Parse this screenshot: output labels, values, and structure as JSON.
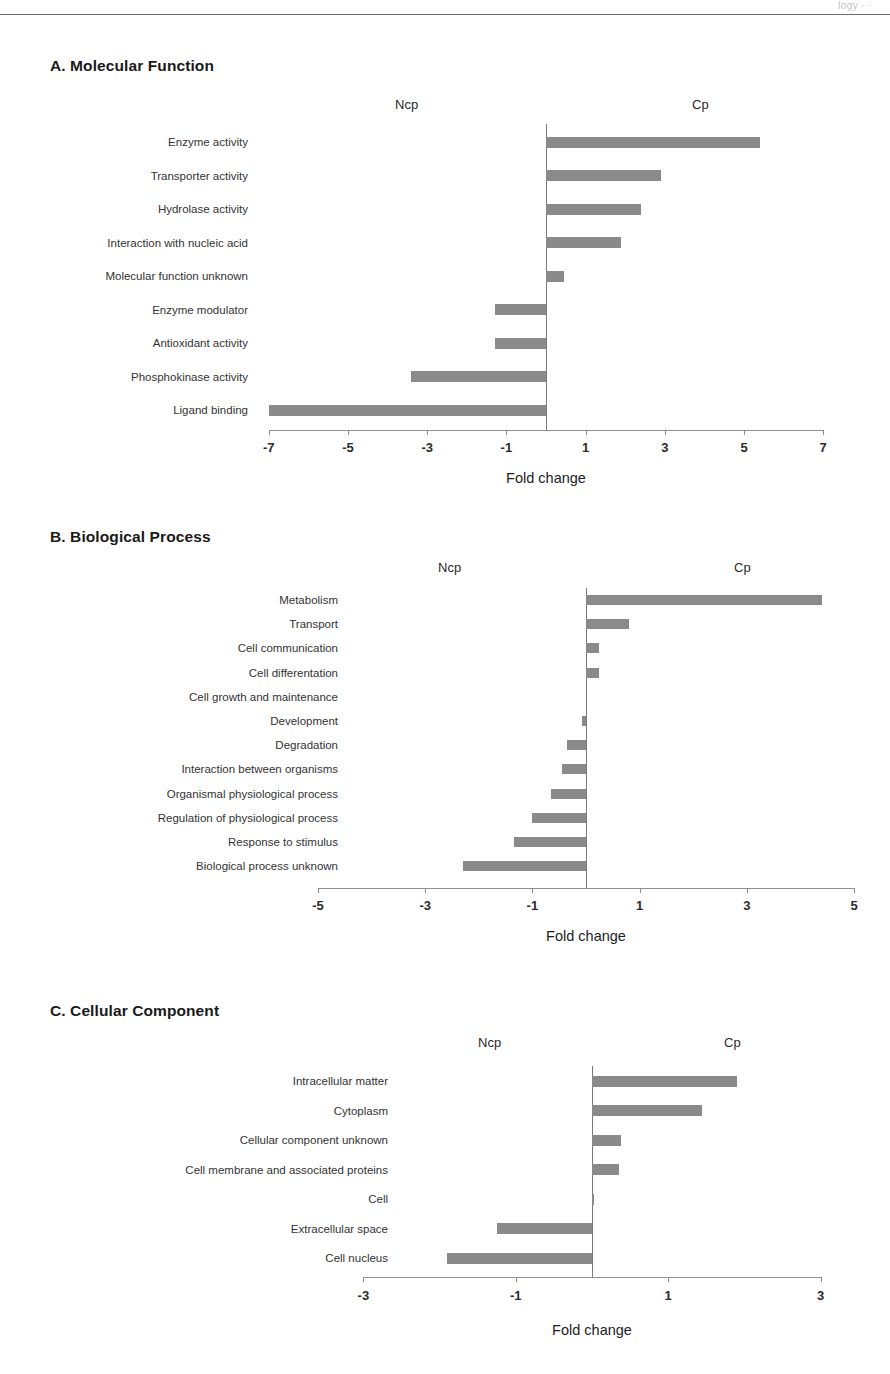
{
  "page": {
    "header_sliver": "logy · ·",
    "bar_color": "#8a8a8a",
    "axis_color": "#8e8e8e"
  },
  "panels": [
    {
      "id": "a",
      "title": "A. Molecular Function",
      "left_group_label": "Ncp",
      "right_group_label": "Cp",
      "axis_title": "Fold change",
      "chart_data": {
        "type": "bar",
        "orientation": "horizontal",
        "title": "A. Molecular Function",
        "xlabel": "Fold change",
        "ylabel": "",
        "xlim": [
          -7,
          7
        ],
        "xticks": [
          -7,
          -5,
          -3,
          -1,
          1,
          3,
          5,
          7
        ],
        "grid": false,
        "legend": [
          "Ncp",
          "Cp"
        ],
        "legend_position": "top",
        "categories": [
          "Enzyme activity",
          "Transporter activity",
          "Hydrolase activity",
          "Interaction with nucleic acid",
          "Molecular function unknown",
          "Enzyme modulator",
          "Antioxidant activity",
          "Phosphokinase activity",
          "Ligand binding"
        ],
        "values": [
          5.4,
          2.9,
          2.4,
          1.9,
          0.45,
          -1.3,
          -1.3,
          -3.4,
          -7.0
        ]
      }
    },
    {
      "id": "b",
      "title": "B. Biological Process",
      "left_group_label": "Ncp",
      "right_group_label": "Cp",
      "axis_title": "Fold change",
      "chart_data": {
        "type": "bar",
        "orientation": "horizontal",
        "title": "B. Biological Process",
        "xlabel": "Fold change",
        "ylabel": "",
        "xlim": [
          -5,
          5
        ],
        "xticks": [
          -5,
          -3,
          -1,
          1,
          3,
          5
        ],
        "grid": false,
        "legend": [
          "Ncp",
          "Cp"
        ],
        "legend_position": "top",
        "categories": [
          "Metabolism",
          "Transport",
          "Cell communication",
          "Cell differentation",
          "Cell growth and maintenance",
          "Development",
          "Degradation",
          "Interaction between organisms",
          "Organismal physiological process",
          "Regulation of physiological process",
          "Response to stimulus",
          "Biological process unknown"
        ],
        "values": [
          4.4,
          0.8,
          0.25,
          0.25,
          0.0,
          -0.08,
          -0.35,
          -0.45,
          -0.65,
          -1.0,
          -1.35,
          -2.3
        ]
      }
    },
    {
      "id": "c",
      "title": "C. Cellular Component",
      "left_group_label": "Ncp",
      "right_group_label": "Cp",
      "axis_title": "Fold change",
      "chart_data": {
        "type": "bar",
        "orientation": "horizontal",
        "title": "C. Cellular Component",
        "xlabel": "Fold change",
        "ylabel": "",
        "xlim": [
          -3,
          3
        ],
        "xticks": [
          -3,
          -1,
          1,
          3
        ],
        "grid": false,
        "legend": [
          "Ncp",
          "Cp"
        ],
        "legend_position": "top",
        "categories": [
          "Intracellular matter",
          "Cytoplasm",
          "Cellular component unknown",
          "Cell membrane and associated proteins",
          "Cell",
          "Extracellular space",
          "Cell nucleus"
        ],
        "values": [
          1.9,
          1.45,
          0.38,
          0.36,
          0.03,
          -1.25,
          -1.9
        ]
      }
    }
  ]
}
